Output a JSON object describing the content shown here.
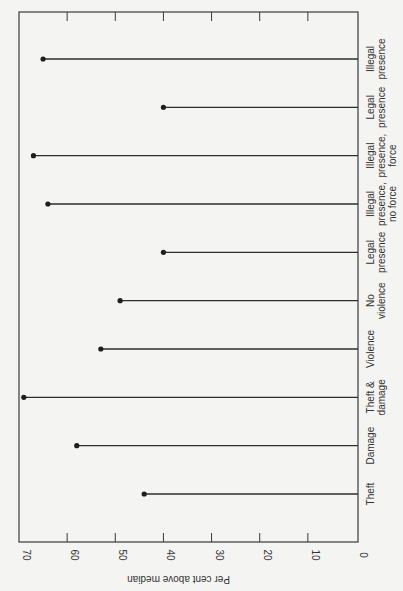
{
  "chart_data": {
    "type": "bar",
    "subtype": "lollipop",
    "orientation": "rotated 90deg (categories along right edge, value axis along bottom increasing leftward)",
    "title": "",
    "xlabel": "",
    "ylabel": "Per cent above median",
    "ylim": [
      0,
      70
    ],
    "yticks": [
      0,
      10,
      20,
      30,
      40,
      50,
      60,
      70
    ],
    "grid": false,
    "legend": null,
    "categories": [
      [
        "Theft"
      ],
      [
        "Damage"
      ],
      [
        "Theft &",
        "damage"
      ],
      [
        "Violence"
      ],
      [
        "No",
        "violence"
      ],
      [
        "Legal",
        "presence"
      ],
      [
        "Illegal",
        "presence,",
        "no force"
      ],
      [
        "Illegal",
        "presence,",
        "force"
      ],
      [
        "Legal",
        "presence"
      ],
      [
        "Illegal",
        "presence"
      ]
    ],
    "values": [
      44,
      58,
      69,
      53,
      49,
      40,
      64,
      67,
      40,
      65
    ]
  }
}
